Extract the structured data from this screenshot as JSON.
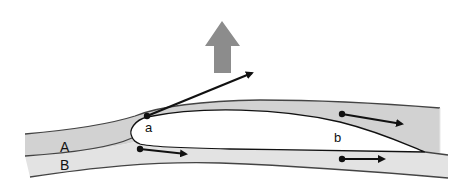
{
  "diagram": {
    "labels": {
      "stream_a": "A",
      "stream_b": "B",
      "point_a": "a",
      "point_b": "b"
    },
    "colors": {
      "stream_a_fill": "#d2d2d2",
      "stream_b_fill": "#e3e3e3",
      "airfoil_fill": "#ffffff",
      "outline": "#333333",
      "lift_arrow": "#8c8c8c",
      "vector_arrows": "#111111"
    },
    "elements": {
      "lift_arrow": "upward lift force",
      "deflected_flow_arrow": "flow vector at leading edge point a",
      "upper_flow_arrow": "flow vector in upper stream near b",
      "lower_flow_arrow_front": "flow vector in lower stream, front",
      "lower_flow_arrow_rear": "flow vector in lower stream, rear"
    }
  }
}
